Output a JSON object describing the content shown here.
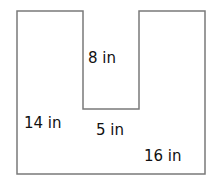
{
  "diagram": {
    "type": "composite-shape",
    "stroke_color": "#7a7a7a",
    "fill_color": "#ffffff",
    "outline_points": [
      [
        17,
        11
      ],
      [
        83,
        11
      ],
      [
        83,
        109
      ],
      [
        139,
        109
      ],
      [
        139,
        11
      ],
      [
        205,
        11
      ],
      [
        205,
        174
      ],
      [
        17,
        174
      ]
    ],
    "labels": [
      {
        "id": "notch-depth",
        "text": "8 in",
        "x": 88,
        "y": 63
      },
      {
        "id": "left-height",
        "text": "14 in",
        "x": 24,
        "y": 128
      },
      {
        "id": "notch-width",
        "text": "5 in",
        "x": 96,
        "y": 135
      },
      {
        "id": "bottom-width",
        "text": "16 in",
        "x": 144,
        "y": 161
      }
    ]
  }
}
